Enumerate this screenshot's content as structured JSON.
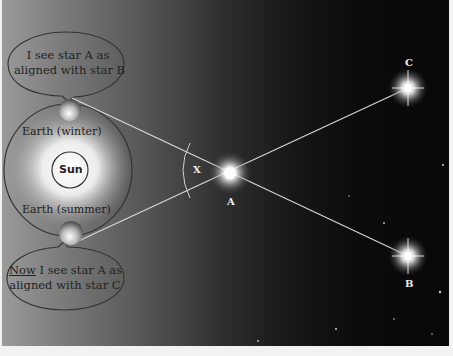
{
  "diagram": {
    "bubbles": {
      "top": {
        "line1": "I see star A as",
        "line2": "aligned with star B"
      },
      "bottom": {
        "emphasis": "Now",
        "line1_rest": " I see star A as",
        "line2": "aligned with star C"
      }
    },
    "labels": {
      "earth_winter": "Earth (winter)",
      "earth_summer": "Earth (summer)",
      "sun": "Sun",
      "angle": "X"
    },
    "stars": [
      {
        "id": "A",
        "label": "A"
      },
      {
        "id": "B",
        "label": "B"
      },
      {
        "id": "C",
        "label": "C"
      }
    ],
    "colors": {
      "line": "#d8d8d8",
      "outline": "#333333",
      "star_glow": "#ffffff"
    }
  }
}
